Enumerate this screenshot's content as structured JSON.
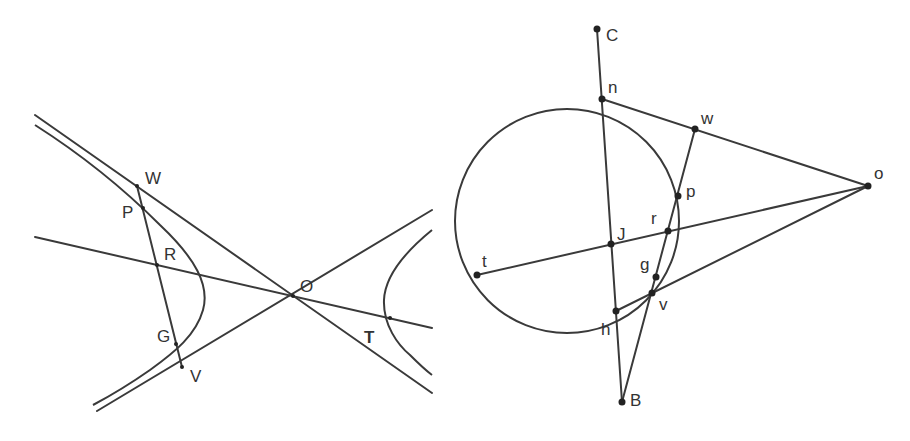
{
  "figures": [
    {
      "name": "hyperbola-figure",
      "description": "Hyperbola with asymptotes through center O, chord WV through P, R, G, and line through R, O, T",
      "labels": {
        "W": "W",
        "P": "P",
        "R": "R",
        "G": "G",
        "V": "V",
        "O": "O",
        "T": "T"
      }
    },
    {
      "name": "circle-figure",
      "description": "Circle with tangents from external point o, secant lines through J and B",
      "labels": {
        "C": "C",
        "n": "n",
        "w": "w",
        "o": "o",
        "p": "p",
        "r": "r",
        "J": "J",
        "t": "t",
        "g": "g",
        "v": "v",
        "h": "h",
        "B": "B"
      }
    }
  ],
  "colors": {
    "stroke": "#3a3a3a",
    "point": "#222222",
    "background": "#ffffff"
  }
}
